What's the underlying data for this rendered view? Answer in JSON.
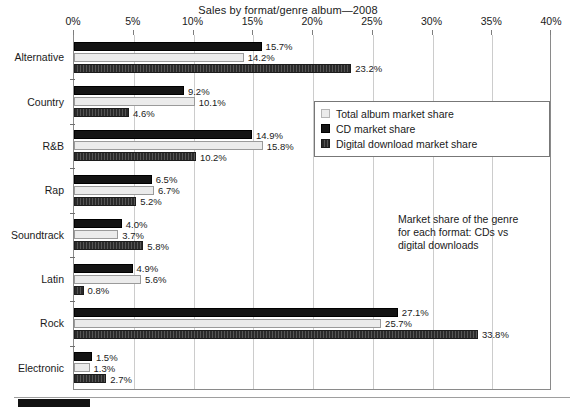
{
  "chart_data": {
    "type": "bar",
    "orientation": "horizontal",
    "title": "Sales by format/genre album—2008",
    "xlabel": "",
    "ylabel": "",
    "xlim": [
      0,
      40
    ],
    "xunit": "%",
    "xticks": [
      "0%",
      "5%",
      "10%",
      "15%",
      "20%",
      "25%",
      "30%",
      "35%",
      "40%"
    ],
    "xtick_values": [
      0,
      5,
      10,
      15,
      20,
      25,
      30,
      35,
      40
    ],
    "grid": "vertical",
    "legend_position": "upper-right-inside",
    "categories": [
      "Alternative",
      "Country",
      "R&B",
      "Rap",
      "Soundtrack",
      "Latin",
      "Rock",
      "Electronic"
    ],
    "series": [
      {
        "name": "CD market share",
        "key": "cd",
        "color": "#141414",
        "values": [
          15.7,
          9.2,
          14.9,
          6.5,
          4.0,
          4.9,
          27.1,
          1.5
        ],
        "labels": [
          "15.7%",
          "9.2%",
          "14.9%",
          "6.5%",
          "4.0%",
          "4.9%",
          "27.1%",
          "1.5%"
        ]
      },
      {
        "name": "Total album market share",
        "key": "total",
        "color": "#ebebeb",
        "values": [
          14.2,
          10.1,
          15.8,
          6.7,
          3.7,
          5.6,
          25.7,
          1.3
        ],
        "labels": [
          "14.2%",
          "10.1%",
          "15.8%",
          "6.7%",
          "3.7%",
          "5.6%",
          "25.7%",
          "1.3%"
        ]
      },
      {
        "name": "Digital download market share",
        "key": "digital",
        "color": "#3b3b3b",
        "values": [
          23.2,
          4.6,
          10.2,
          5.2,
          5.8,
          0.8,
          33.8,
          2.7
        ],
        "labels": [
          "23.2%",
          "4.6%",
          "10.2%",
          "5.2%",
          "5.8%",
          "0.8%",
          "33.8%",
          "2.7%"
        ]
      }
    ],
    "series_draw_order": [
      "cd",
      "total",
      "digital"
    ],
    "annotation": "Market share of the genre for each format: CDs vs digital downloads"
  },
  "legend": {
    "items": [
      {
        "label": "Total album market share",
        "swatch": "total"
      },
      {
        "label": "CD market share",
        "swatch": "cd"
      },
      {
        "label": "Digital download market share",
        "swatch": "digital"
      }
    ]
  },
  "annotation": {
    "line1": "Market share of the genre",
    "line2": "for each format: CDs vs",
    "line3": "digital downloads"
  }
}
